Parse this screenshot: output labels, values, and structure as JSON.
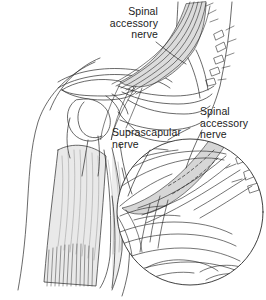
{
  "figure": {
    "type": "line-drawing-anatomical-illustration",
    "background_color": "#ffffff",
    "line_color": "#2a2a2a",
    "text_color": "#1b1b1b",
    "shade_color": "#e3e3e3",
    "shade_color_dark": "#bdbdbd"
  },
  "labels": {
    "spinal_accessory_top": "Spinal\naccessory\nnerve",
    "spinal_accessory_right": "Spinal\naccessory\nnerve",
    "suprascapular": "Suprascapular\nnerve"
  },
  "regions": {
    "shoulder_view": "left-anterior-shoulder-and-neck",
    "magnified_inset": "circular-detail-view-lower-right",
    "deltoid": "deltoid-muscle-hatched",
    "clavicle": "clavicle",
    "acromion": "acromion",
    "humeral_head": "humeral-head",
    "nerve_plexus": "brachial-plexus-nerve-roots",
    "vertebral_processes": "cervical-transverse-processes"
  }
}
